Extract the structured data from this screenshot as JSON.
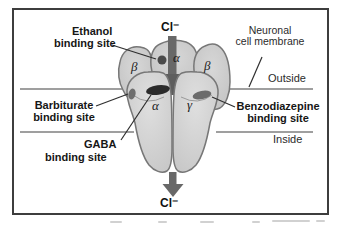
{
  "diagram": {
    "binding_site_labels": {
      "ethanol": {
        "line1": "Ethanol",
        "line2": "binding site"
      },
      "barbiturate": {
        "line1": "Barbiturate",
        "line2": "binding site"
      },
      "gaba": {
        "line1": "GABA",
        "line2": "binding site"
      },
      "benzodiazepine": {
        "line1": "Benzodiazepine",
        "line2": "binding site"
      }
    },
    "membrane": {
      "label_line1": "Neuronal",
      "label_line2": "cell membrane",
      "outside": "Outside",
      "inside": "Inside"
    },
    "ions": {
      "top": "Cl⁻",
      "bottom": "Cl⁻"
    },
    "subunits": {
      "beta_back_left": "β",
      "alpha_back_center": "α",
      "beta_back_right": "β",
      "alpha_front": "α",
      "gamma_front": "γ"
    },
    "colors": {
      "frame_border": "#3d3d3d",
      "membrane_line": "#7f7f7f",
      "subunit_fill_back": "#c9c9c9",
      "subunit_fill_front": "#d4d4d4",
      "subunit_outline": "#777777",
      "channel_arrow": "#686868",
      "gaba_site": "#2b2b2b",
      "benzodiazepine_site": "#6b6b6b",
      "barbiturate_site": "#6e6e6e",
      "ethanol_site": "#4a4a4a"
    }
  }
}
